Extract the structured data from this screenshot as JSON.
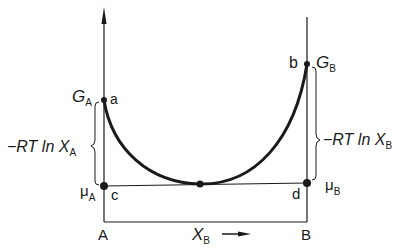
{
  "diagram": {
    "type": "free-energy-composition",
    "axis_left": {
      "label": "A",
      "free_energy_label": "G",
      "free_energy_sub": "A",
      "chem_potential_label": "μ",
      "chem_potential_sub": "A"
    },
    "axis_right": {
      "label": "B",
      "free_energy_label": "G",
      "free_energy_sub": "B",
      "chem_potential_label": "μ",
      "chem_potential_sub": "B"
    },
    "x_axis": {
      "label": "X",
      "label_sub": "B",
      "arrow": "right-arrow"
    },
    "points": [
      {
        "id": "a",
        "label": "a"
      },
      {
        "id": "b",
        "label": "b"
      },
      {
        "id": "c",
        "label": "c"
      },
      {
        "id": "d",
        "label": "d"
      },
      {
        "id": "tangent",
        "label": ""
      }
    ],
    "brace_left": {
      "text_main": "−RT ln X",
      "text_sub": "A"
    },
    "brace_right": {
      "text_main": "−RT ln X",
      "text_sub": "B"
    },
    "colors": {
      "ink": "#1a1a1a",
      "background": "#ffffff"
    }
  }
}
